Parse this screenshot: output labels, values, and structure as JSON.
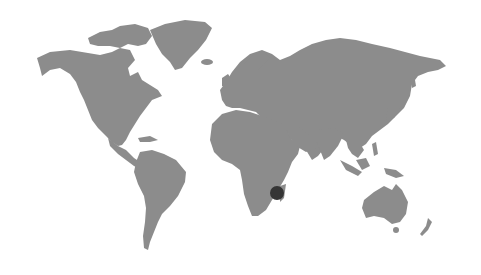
{
  "map": {
    "type": "world-map",
    "style": "grayscale-halftone",
    "colors": {
      "background": "#ffffff",
      "land": "#8c8c8c",
      "marker": "#353535"
    },
    "markers": [
      {
        "name": "location-marker",
        "region": "Madagascar / Southeast Africa",
        "x": 277,
        "y": 193,
        "r": 7
      }
    ]
  }
}
